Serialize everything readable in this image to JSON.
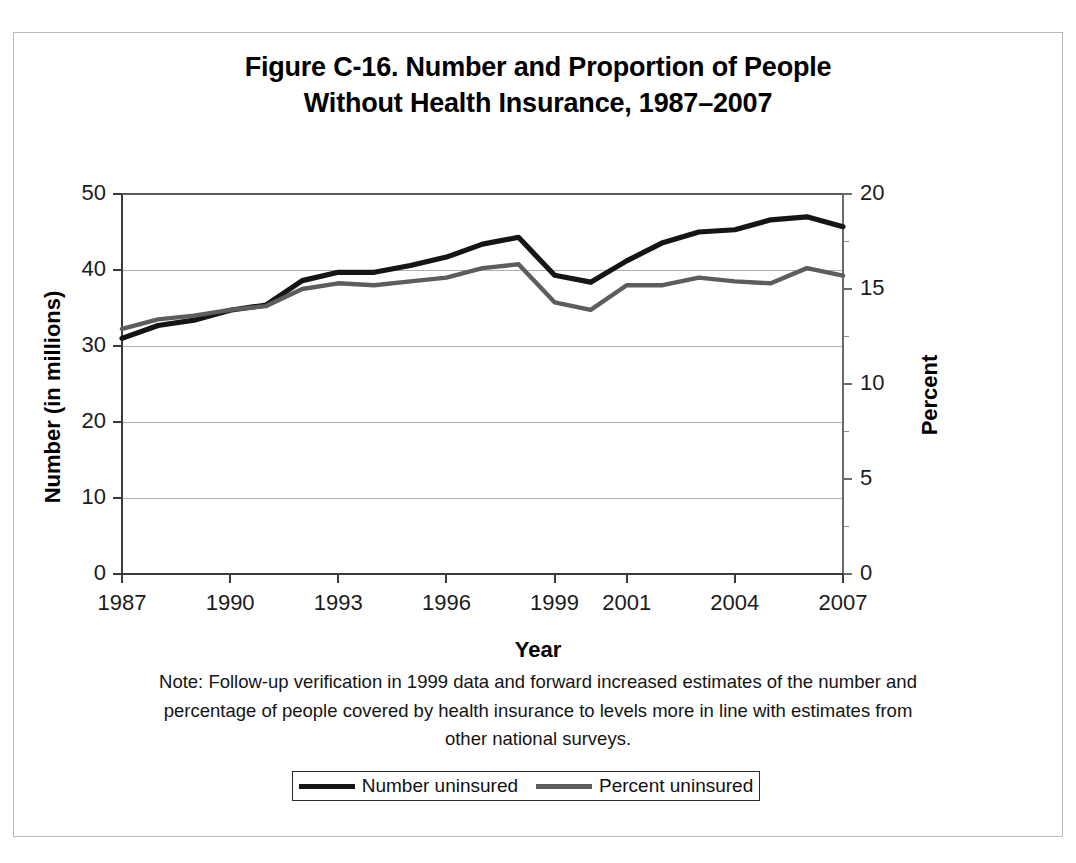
{
  "figure": {
    "title_line1": "Figure C-16. Number and Proportion of People",
    "title_line2": "Without Health Insurance, 1987–2007"
  },
  "axes": {
    "y_left_title": "Number (in millions)",
    "y_right_title": "Percent",
    "x_title": "Year"
  },
  "note": {
    "line1": "Note: Follow-up verification in 1999 data and forward increased estimates of the number and",
    "line2": "percentage of people covered by health insurance to levels more in line with estimates from",
    "line3": "other national surveys."
  },
  "legend": {
    "items": [
      {
        "label": "Number uninsured",
        "color": "#151515"
      },
      {
        "label": "Percent uninsured",
        "color": "#5d5d5d"
      }
    ]
  },
  "chart_data": {
    "type": "line",
    "title": "Figure C-16. Number and Proportion of People Without Health Insurance, 1987–2007",
    "xlabel": "Year",
    "ylabel": "Number (in millions)",
    "y2label": "Percent",
    "grid": true,
    "legend_position": "bottom",
    "x": [
      1987,
      1988,
      1989,
      1990,
      1991,
      1992,
      1993,
      1994,
      1995,
      1996,
      1997,
      1998,
      1999,
      2000,
      2001,
      2002,
      2003,
      2004,
      2005,
      2006,
      2007
    ],
    "x_tick_labels": [
      "1987",
      "1990",
      "1993",
      "1996",
      "1999",
      "2001",
      "2004",
      "2007"
    ],
    "x_tick_values": [
      1987,
      1990,
      1993,
      1996,
      1999,
      2001,
      2004,
      2007
    ],
    "ylim": [
      0,
      50
    ],
    "y_ticks": [
      0,
      10,
      20,
      30,
      40,
      50
    ],
    "y_tick_labels": [
      "0",
      "10",
      "20",
      "30",
      "40",
      "50"
    ],
    "y2lim": [
      0,
      20
    ],
    "y2_ticks": [
      0,
      5,
      10,
      15,
      20
    ],
    "y2_tick_labels": [
      "0",
      "5",
      "10",
      "15",
      "20"
    ],
    "y2_minor_ticks": [
      2.5,
      7.5,
      12.5,
      17.5
    ],
    "series": [
      {
        "name": "Number uninsured",
        "axis": "left",
        "units": "millions",
        "color": "#151515",
        "values": [
          31.0,
          32.7,
          33.4,
          34.7,
          35.4,
          38.6,
          39.7,
          39.7,
          40.6,
          41.7,
          43.4,
          44.3,
          39.3,
          38.4,
          41.2,
          43.6,
          45.0,
          45.3,
          46.6,
          47.0,
          45.7
        ]
      },
      {
        "name": "Percent uninsured",
        "axis": "right",
        "units": "percent",
        "color": "#5d5d5d",
        "values": [
          12.9,
          13.4,
          13.6,
          13.9,
          14.1,
          15.0,
          15.3,
          15.2,
          15.4,
          15.6,
          16.1,
          16.3,
          14.3,
          13.9,
          15.2,
          15.2,
          15.6,
          15.4,
          15.3,
          16.1,
          15.7
        ]
      }
    ]
  }
}
